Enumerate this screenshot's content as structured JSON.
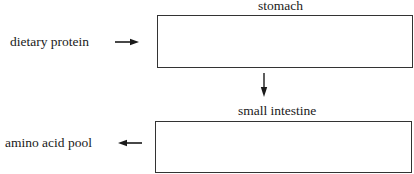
{
  "diagram": {
    "type": "flow",
    "nodes": [
      {
        "id": "dietary_protein",
        "label": "dietary protein",
        "kind": "text"
      },
      {
        "id": "stomach",
        "label": "stomach",
        "kind": "box",
        "content": ""
      },
      {
        "id": "small_intestine",
        "label": "small intestine",
        "kind": "box",
        "content": ""
      },
      {
        "id": "amino_acid_pool",
        "label": "amino acid pool",
        "kind": "text"
      }
    ],
    "edges": [
      {
        "from": "dietary_protein",
        "to": "stomach",
        "direction": "right"
      },
      {
        "from": "stomach",
        "to": "small_intestine",
        "direction": "down"
      },
      {
        "from": "small_intestine",
        "to": "amino_acid_pool",
        "direction": "left"
      }
    ]
  },
  "labels": {
    "dietary_protein": "dietary protein",
    "stomach": "stomach",
    "small_intestine": "small intestine",
    "amino_acid_pool": "amino acid pool"
  },
  "colors": {
    "stroke": "#333333",
    "text": "#1a1a1a",
    "background": "#ffffff"
  }
}
